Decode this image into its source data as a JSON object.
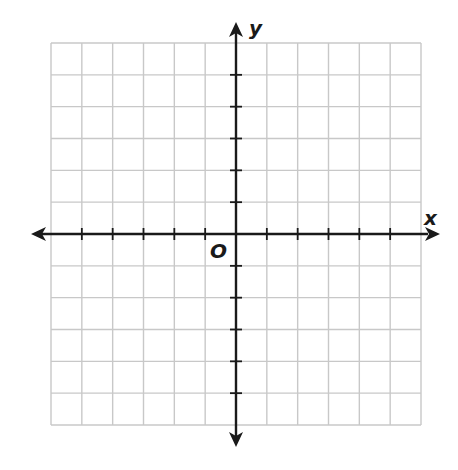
{
  "chart_data": {
    "type": "coordinate-grid",
    "title": "",
    "xlabel": "x",
    "ylabel": "y",
    "origin_label": "O",
    "xlim": [
      -6,
      6
    ],
    "ylim": [
      -6,
      6
    ],
    "grid": true,
    "grid_cells_x": 12,
    "grid_cells_y": 12,
    "tick_marks": true,
    "tick_labels": false,
    "x_ticks": [
      -5,
      -4,
      -3,
      -2,
      -1,
      1,
      2,
      3,
      4,
      5
    ],
    "y_ticks": [
      -5,
      -4,
      -3,
      -2,
      -1,
      1,
      2,
      3,
      4,
      5
    ],
    "arrows": [
      "left",
      "right",
      "up",
      "down"
    ],
    "series": []
  },
  "labels": {
    "x_axis": "x",
    "y_axis": "y",
    "origin": "O"
  },
  "colors": {
    "grid": "#c8c8c8",
    "axis": "#1a1a1a",
    "background": "#ffffff"
  }
}
